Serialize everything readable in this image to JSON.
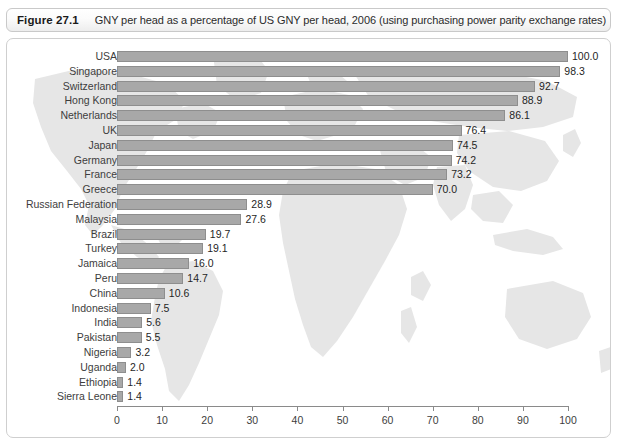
{
  "figure": {
    "number": "Figure 27.1",
    "caption": "GNY per head as a percentage of US GNY per head, 2006 (using purchasing power parity exchange rates)"
  },
  "colors": {
    "bar_fill": "#a8a8a8",
    "bar_stroke": "#8e8e8e",
    "map_fill": "#e4e4e4",
    "frame_border": "#cfcfcf",
    "caption_border": "#c9c9c9",
    "text": "#3d3d3d"
  },
  "chart_data": {
    "type": "bar",
    "orientation": "horizontal",
    "title": "GNY per head as a percentage of US GNY per head, 2006 (using purchasing power parity exchange rates)",
    "xlabel": "",
    "ylabel": "",
    "xlim": [
      0,
      100
    ],
    "grid": false,
    "legend": null,
    "xticks": [
      0,
      10,
      20,
      30,
      40,
      50,
      60,
      70,
      80,
      90,
      100
    ],
    "xtick_labels": [
      "0",
      "10",
      "20",
      "30",
      "40",
      "50",
      "60",
      "70",
      "80",
      "90",
      "100"
    ],
    "categories": [
      "USA",
      "Singapore",
      "Switzerland",
      "Hong Kong",
      "Netherlands",
      "UK",
      "Japan",
      "Germany",
      "France",
      "Greece",
      "Russian Federation",
      "Malaysia",
      "Brazil",
      "Turkey",
      "Jamaica",
      "Peru",
      "China",
      "Indonesia",
      "India",
      "Pakistan",
      "Nigeria",
      "Uganda",
      "Ethiopia",
      "Sierra Leone"
    ],
    "values": [
      100.0,
      98.3,
      92.7,
      88.9,
      86.1,
      76.4,
      74.5,
      74.2,
      73.2,
      70.0,
      28.9,
      27.6,
      19.7,
      19.1,
      16.0,
      14.7,
      10.6,
      7.5,
      5.6,
      5.5,
      3.2,
      2.0,
      1.4,
      1.4
    ],
    "value_labels": [
      "100.0",
      "98.3",
      "92.7",
      "88.9",
      "86.1",
      "76.4",
      "74.5",
      "74.2",
      "73.2",
      "70.0",
      "28.9",
      "27.6",
      "19.7",
      "19.1",
      "16.0",
      "14.7",
      "10.6",
      "7.5",
      "5.6",
      "5.5",
      "3.2",
      "2.0",
      "1.4",
      "1.4"
    ]
  }
}
